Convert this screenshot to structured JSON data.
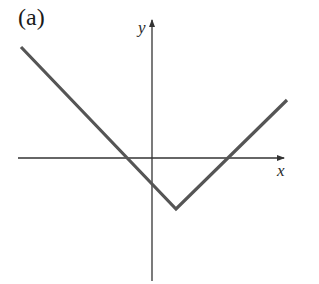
{
  "figure": {
    "panel_label": "(a)",
    "x_axis_label": "x",
    "y_axis_label": "y"
  },
  "colors": {
    "axis": "#333333",
    "curve": "#555555",
    "background": "#ffffff"
  },
  "geometry": {
    "x_axis": {
      "x1": 18,
      "x2": 284,
      "y": 158
    },
    "y_axis": {
      "x": 152,
      "y1": 281,
      "y2": 20
    },
    "curve_points": [
      [
        21,
        47
      ],
      [
        176,
        209
      ],
      [
        287,
        100
      ]
    ]
  }
}
